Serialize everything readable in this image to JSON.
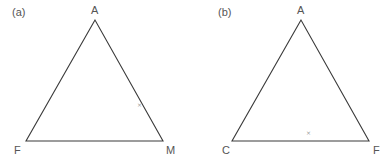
{
  "figure": {
    "panels": [
      {
        "id": "a",
        "label": "(a)",
        "vertices": {
          "top": {
            "name": "A",
            "x": 95,
            "y": 20
          },
          "bottom_left": {
            "name": "F",
            "x": 26,
            "y": 141
          },
          "bottom_right": {
            "name": "M",
            "x": 163,
            "y": 141
          }
        },
        "marker": {
          "symbol": "×",
          "x": 139,
          "y": 105
        }
      },
      {
        "id": "b",
        "label": "(b)",
        "vertices": {
          "top": {
            "name": "A",
            "x": 301,
            "y": 20
          },
          "bottom_left": {
            "name": "C",
            "x": 232,
            "y": 141
          },
          "bottom_right": {
            "name": "F",
            "x": 369,
            "y": 141
          }
        },
        "marker": {
          "symbol": "×",
          "x": 308,
          "y": 133
        }
      }
    ],
    "colors": {
      "line": "#3a3a3a",
      "text": "#555555",
      "marker": "#999999",
      "background": "#ffffff"
    }
  }
}
